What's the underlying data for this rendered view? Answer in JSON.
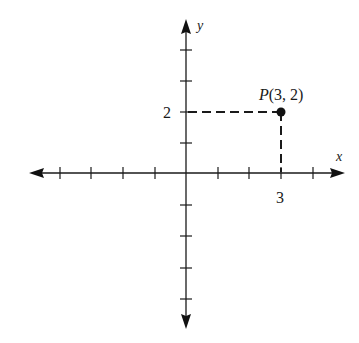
{
  "diagram": {
    "type": "coordinate-plane",
    "axes": {
      "x_label": "x",
      "y_label": "y",
      "x_ticks": [
        -5,
        -4,
        -3,
        -2,
        -1,
        1,
        2,
        3,
        4
      ],
      "y_ticks": [
        -4,
        -3,
        -2,
        -1,
        1,
        2,
        3,
        4
      ],
      "labeled_x_tick": "3",
      "labeled_y_tick": "2"
    },
    "point": {
      "name": "P",
      "label": "P(3, 2)",
      "label_prefix": "P",
      "label_coords": "(3, 2)",
      "x": 3,
      "y": 2
    },
    "colors": {
      "axis": "#1a1a1a",
      "point": "#111111",
      "dashed": "#1a1a1a"
    }
  }
}
